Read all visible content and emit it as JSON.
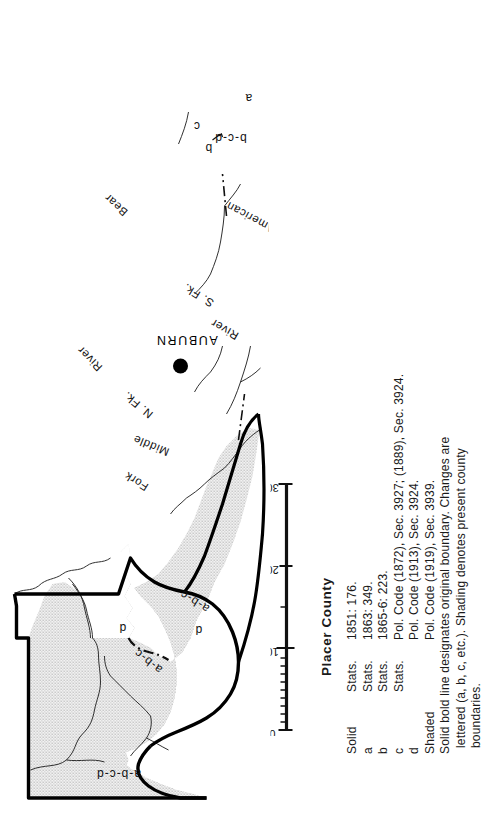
{
  "map": {
    "title": "Placer County",
    "city": {
      "name": "AUBURN"
    },
    "scale": {
      "ticks": [
        "0",
        "10",
        "20",
        "30"
      ],
      "values": [
        0,
        10,
        20,
        30
      ]
    },
    "boundary_labels": [
      {
        "id": "abcd",
        "text": "a-b-c-d"
      },
      {
        "id": "abc-upper",
        "text": "a-b-c"
      },
      {
        "id": "abc-lower",
        "text": "a-b-c"
      },
      {
        "id": "d-upper",
        "text": "d"
      },
      {
        "id": "d-lower",
        "text": "d"
      },
      {
        "id": "bcd",
        "text": "b-c-d"
      },
      {
        "id": "a-south",
        "text": "a"
      },
      {
        "id": "b-south",
        "text": "b"
      },
      {
        "id": "c-south",
        "text": "c"
      }
    ],
    "river_labels": [
      {
        "id": "bear",
        "text": "Bear"
      },
      {
        "id": "river-north",
        "text": "River"
      },
      {
        "id": "n-fk",
        "text": "N. Fk."
      },
      {
        "id": "middle",
        "text": "Middle"
      },
      {
        "id": "fork",
        "text": "Fork"
      },
      {
        "id": "river-south",
        "text": "River"
      },
      {
        "id": "s-fk",
        "text": "S. Fk."
      },
      {
        "id": "american",
        "text": "American"
      }
    ]
  },
  "legend": {
    "title": "Placer County",
    "rows": [
      {
        "key": "Solid",
        "source": "",
        "citation": "1851: 176."
      },
      {
        "key": "a",
        "source": "Stats.",
        "citation": "1863: 349."
      },
      {
        "key": "b",
        "source": "Stats.",
        "citation": "1865-6: 223."
      },
      {
        "key": "c",
        "source": "Stats.",
        "citation": "Pol. Code (1872), Sec. 3927; (1889), Sec. 3924."
      },
      {
        "key": "d",
        "source": "",
        "citation": "Pol. Code (1913), Sec. 3924."
      },
      {
        "key": "Shaded",
        "source": "",
        "citation": "Pol. Code (1919), Sec. 3939."
      }
    ],
    "first_row_source": "Stats.",
    "note_line_1": "Solid bold line designates original boundary.  Changes are",
    "note_line_2": "lettered (a, b, c, etc.).  Shading denotes present county",
    "note_line_3": "boundaries."
  },
  "colors": {
    "ink": "#1a1a1a",
    "shading": "#d7d7d7",
    "paper": "#ffffff",
    "boundary": "#000000"
  }
}
